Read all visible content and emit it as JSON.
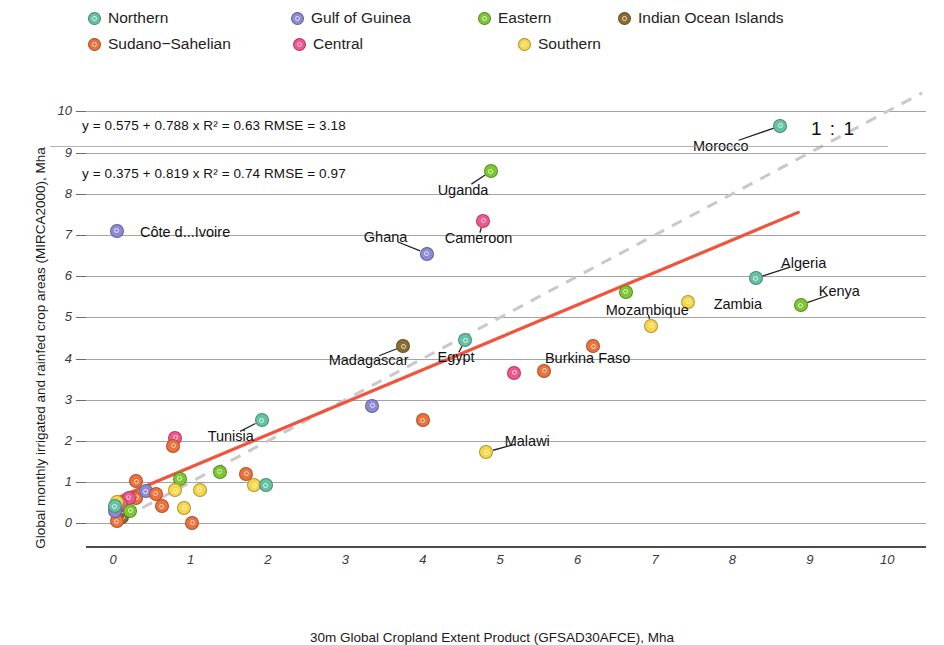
{
  "legend": {
    "rows": [
      [
        {
          "label": "Northern",
          "color": "#66c2a5"
        },
        {
          "label": "Gulf of Guinea",
          "color": "#8f8ad6"
        },
        {
          "label": "Eastern",
          "color": "#7dc832"
        },
        {
          "label": "Indian Ocean Islands",
          "color": "#8c6d31"
        }
      ],
      [
        {
          "label": "Sudano−Sahelian",
          "color": "#f0713a"
        },
        {
          "label": "Central",
          "color": "#f4558f"
        },
        {
          "label": "Southern",
          "color": "#f7d648"
        }
      ]
    ]
  },
  "annotations": {
    "eq1": "y = 0.575 + 0.788 x   R² = 0.63   RMSE = 3.18",
    "eq1_parts": {
      "lhs": "y",
      "intercept": "0.575",
      "slope": "0.788",
      "r2": "0.63",
      "rmse": "3.18"
    },
    "eq2": "y = 0.375 + 0.819 x   R² = 0.74   RMSE = 0.97",
    "eq2_parts": {
      "lhs": "y",
      "intercept": "0.375",
      "slope": "0.819",
      "r2": "0.74",
      "rmse": "0.97"
    },
    "one_to_one": "1 : 1"
  },
  "chart_data": {
    "type": "scatter",
    "title": "",
    "xlabel": "30m Global Cropland Extent Product (GFSAD30AFCE), Mha",
    "ylabel": "Global monthly irrigated and rainfed crop areas (MIRCA2000), Mha",
    "xlim": [
      -0.35,
      10.5
    ],
    "ylim": [
      -0.55,
      10.35
    ],
    "xticks": [
      "0",
      "1",
      "2",
      "3",
      "4",
      "5",
      "6",
      "7",
      "8",
      "9",
      "10"
    ],
    "yticks": [
      "0",
      "1",
      "2",
      "3",
      "4",
      "5",
      "6",
      "7",
      "8",
      "9",
      "10"
    ],
    "grid": "horizontal",
    "legend_position": "top",
    "fit_line": {
      "color": "#f0543c",
      "intercept": 0.575,
      "slope": 0.788,
      "x_start": 0.0,
      "x_end": 8.85
    },
    "reference_line": {
      "label": "1 : 1",
      "color": "#c9c9c9",
      "style": "dashed",
      "slope": 1,
      "intercept": 0
    },
    "groups": [
      {
        "name": "Northern",
        "color": "#66c2a5"
      },
      {
        "name": "Gulf of Guinea",
        "color": "#8f8ad6"
      },
      {
        "name": "Eastern",
        "color": "#7dc832"
      },
      {
        "name": "Indian Ocean Islands",
        "color": "#8c6d31"
      },
      {
        "name": "Sudano−Sahelian",
        "color": "#f0713a"
      },
      {
        "name": "Central",
        "color": "#f4558f"
      },
      {
        "name": "Southern",
        "color": "#f7d648"
      }
    ],
    "points": [
      {
        "label": "Morocco",
        "group": "Northern",
        "x": 8.62,
        "y": 9.65,
        "label_pos": {
          "x": 7.85,
          "y": 9.15
        },
        "leader": true
      },
      {
        "label": "Uganda",
        "group": "Eastern",
        "x": 4.88,
        "y": 8.55,
        "label_pos": {
          "x": 4.52,
          "y": 8.1
        },
        "leader": true
      },
      {
        "label": "Cameroon",
        "group": "Central",
        "x": 4.78,
        "y": 7.35,
        "label_pos": {
          "x": 4.72,
          "y": 6.93
        },
        "leader": true
      },
      {
        "label": "Côte d...Ivoire",
        "group": "Gulf of Guinea",
        "x": 0.05,
        "y": 7.1,
        "label_pos": {
          "x": 0.93,
          "y": 7.08
        },
        "leader": false
      },
      {
        "label": "Ghana",
        "group": "Gulf of Guinea",
        "x": 4.05,
        "y": 6.55,
        "label_pos": {
          "x": 3.52,
          "y": 6.95
        },
        "leader": true
      },
      {
        "label": "Algeria",
        "group": "Northern",
        "x": 8.3,
        "y": 5.95,
        "label_pos": {
          "x": 8.92,
          "y": 6.33
        },
        "leader": true
      },
      {
        "label": "Kenya",
        "group": "Eastern",
        "x": 8.88,
        "y": 5.3,
        "label_pos": {
          "x": 9.38,
          "y": 5.63
        },
        "leader": true
      },
      {
        "label": "Zambia",
        "group": "Southern",
        "x": 7.43,
        "y": 5.38,
        "label_pos": {
          "x": 8.07,
          "y": 5.33
        },
        "leader": false
      },
      {
        "label": "Mozambique",
        "group": "Southern",
        "x": 6.95,
        "y": 4.8,
        "label_pos": {
          "x": 6.9,
          "y": 5.18
        },
        "leader": true
      },
      {
        "label": "",
        "group": "Eastern",
        "x": 6.62,
        "y": 5.62,
        "label_pos": null,
        "leader": false
      },
      {
        "label": "Egypt",
        "group": "Northern",
        "x": 4.55,
        "y": 4.45,
        "label_pos": {
          "x": 4.43,
          "y": 4.03
        },
        "leader": true
      },
      {
        "label": "Madagascar",
        "group": "Indian Ocean Islands",
        "x": 3.75,
        "y": 4.3,
        "label_pos": {
          "x": 3.3,
          "y": 3.97
        },
        "leader": true
      },
      {
        "label": "Burkina Faso",
        "group": "Sudano−Sahelian",
        "x": 6.2,
        "y": 4.3,
        "label_pos": {
          "x": 6.13,
          "y": 4.02
        },
        "leader": false
      },
      {
        "label": "",
        "group": "Sudano−Sahelian",
        "x": 5.57,
        "y": 3.7,
        "label_pos": null,
        "leader": false
      },
      {
        "label": "",
        "group": "Central",
        "x": 5.18,
        "y": 3.65,
        "label_pos": null,
        "leader": false
      },
      {
        "label": "",
        "group": "Gulf of Guinea",
        "x": 3.35,
        "y": 2.85,
        "label_pos": null,
        "leader": false
      },
      {
        "label": "",
        "group": "Sudano−Sahelian",
        "x": 4.0,
        "y": 2.5,
        "label_pos": null,
        "leader": false
      },
      {
        "label": "Tunisia",
        "group": "Northern",
        "x": 1.92,
        "y": 2.5,
        "label_pos": {
          "x": 1.52,
          "y": 2.12
        },
        "leader": true
      },
      {
        "label": "Malawi",
        "group": "Southern",
        "x": 4.82,
        "y": 1.73,
        "label_pos": {
          "x": 5.35,
          "y": 2.0
        },
        "leader": true
      },
      {
        "label": "",
        "group": "Central",
        "x": 0.8,
        "y": 2.08,
        "label_pos": null,
        "leader": false
      },
      {
        "label": "",
        "group": "Sudano−Sahelian",
        "x": 0.78,
        "y": 1.88,
        "label_pos": null,
        "leader": false
      },
      {
        "label": "",
        "group": "Eastern",
        "x": 1.38,
        "y": 1.25,
        "label_pos": null,
        "leader": false
      },
      {
        "label": "",
        "group": "Eastern",
        "x": 0.86,
        "y": 1.08,
        "label_pos": null,
        "leader": false
      },
      {
        "label": "",
        "group": "Southern",
        "x": 1.12,
        "y": 0.82,
        "label_pos": null,
        "leader": false
      },
      {
        "label": "",
        "group": "Sudano−Sahelian",
        "x": 1.72,
        "y": 1.2,
        "label_pos": null,
        "leader": false
      },
      {
        "label": "",
        "group": "Southern",
        "x": 1.82,
        "y": 0.92,
        "label_pos": null,
        "leader": false
      },
      {
        "label": "",
        "group": "Northern",
        "x": 1.97,
        "y": 0.92,
        "label_pos": null,
        "leader": false
      },
      {
        "label": "",
        "group": "Sudano−Sahelian",
        "x": 0.3,
        "y": 1.02,
        "label_pos": null,
        "leader": false
      },
      {
        "label": "",
        "group": "Sudano−Sahelian",
        "x": 0.3,
        "y": 0.62,
        "label_pos": null,
        "leader": false
      },
      {
        "label": "",
        "group": "Gulf of Guinea",
        "x": 0.42,
        "y": 0.78,
        "label_pos": null,
        "leader": false
      },
      {
        "label": "",
        "group": "Central",
        "x": 0.2,
        "y": 0.62,
        "label_pos": null,
        "leader": false
      },
      {
        "label": "",
        "group": "Sudano−Sahelian",
        "x": 0.55,
        "y": 0.72,
        "label_pos": null,
        "leader": false
      },
      {
        "label": "",
        "group": "Sudano−Sahelian",
        "x": 0.63,
        "y": 0.42,
        "label_pos": null,
        "leader": false
      },
      {
        "label": "",
        "group": "Southern",
        "x": 0.92,
        "y": 0.38,
        "label_pos": null,
        "leader": false
      },
      {
        "label": "",
        "group": "Southern",
        "x": 0.8,
        "y": 0.8,
        "label_pos": null,
        "leader": false
      },
      {
        "label": "",
        "group": "Indian Ocean Islands",
        "x": 0.12,
        "y": 0.15,
        "label_pos": null,
        "leader": false
      },
      {
        "label": "",
        "group": "Indian Ocean Islands",
        "x": 0.12,
        "y": 0.32,
        "label_pos": null,
        "leader": false
      },
      {
        "label": "",
        "group": "Central",
        "x": 0.1,
        "y": 0.48,
        "label_pos": null,
        "leader": false
      },
      {
        "label": "",
        "group": "Sudano−Sahelian",
        "x": 1.02,
        "y": 0.02,
        "label_pos": null,
        "leader": false
      },
      {
        "label": "",
        "group": "Sudano−Sahelian",
        "x": 0.05,
        "y": 0.05,
        "label_pos": null,
        "leader": false
      },
      {
        "label": "",
        "group": "Gulf of Guinea",
        "x": 0.02,
        "y": 0.3,
        "label_pos": null,
        "leader": false
      },
      {
        "label": "",
        "group": "Southern",
        "x": 0.05,
        "y": 0.52,
        "label_pos": null,
        "leader": false
      },
      {
        "label": "",
        "group": "Northern",
        "x": 0.02,
        "y": 0.42,
        "label_pos": null,
        "leader": false
      },
      {
        "label": "",
        "group": "Eastern",
        "x": 0.22,
        "y": 0.3,
        "label_pos": null,
        "leader": false
      }
    ]
  }
}
